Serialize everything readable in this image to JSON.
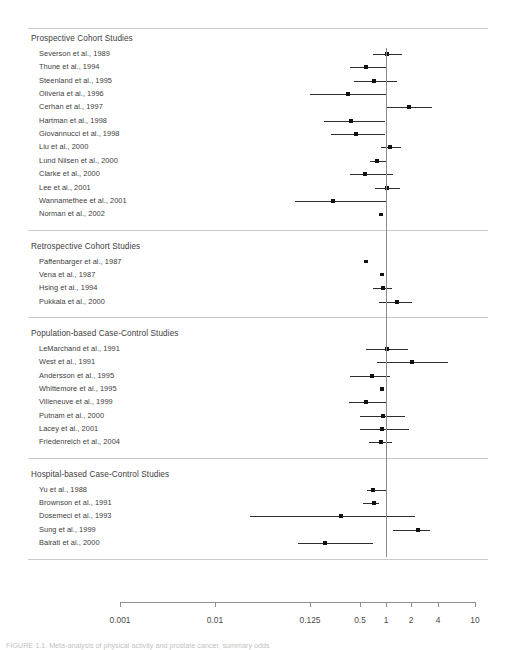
{
  "chart_data": {
    "type": "scatter",
    "title": "",
    "xlabel": "",
    "ylabel": "",
    "xscale": "log",
    "xlim": [
      0.001,
      10
    ],
    "grid": false,
    "legend": null,
    "reference_line": 1,
    "tick_labels": [
      "0.001",
      "0.01",
      "0.125",
      "0.5",
      "1",
      "2",
      "4",
      "10"
    ],
    "tick_values": [
      0.001,
      0.01,
      0.125,
      0.5,
      1,
      2,
      4,
      10
    ],
    "tick_x_px": [
      120,
      215,
      310,
      360,
      386,
      411,
      438,
      475
    ],
    "groups": [
      {
        "name": "Prospective Cohort Studies",
        "rows": [
          {
            "label": "Severson et al., 1989",
            "x_px": 387,
            "lo_px": 373,
            "hi_px": 402,
            "size": 4.0
          },
          {
            "label": "Thune et al., 1994",
            "x_px": 366,
            "lo_px": 350,
            "hi_px": 386,
            "size": 4.0
          },
          {
            "label": "Steenland et al., 1995",
            "x_px": 374,
            "lo_px": 354,
            "hi_px": 397,
            "size": 4.0
          },
          {
            "label": "Oliveria et al., 1996",
            "x_px": 348,
            "lo_px": 310,
            "hi_px": 386,
            "size": 4.0
          },
          {
            "label": "Cerhan et al., 1997",
            "x_px": 409,
            "lo_px": 386,
            "hi_px": 432,
            "size": 4.0
          },
          {
            "label": "Hartman et al., 1998",
            "x_px": 351,
            "lo_px": 324,
            "hi_px": 385,
            "size": 4.0
          },
          {
            "label": "Giovannucci et al., 1998",
            "x_px": 356,
            "lo_px": 331,
            "hi_px": 385,
            "size": 4.0
          },
          {
            "label": "Liu et al., 2000",
            "x_px": 390,
            "lo_px": 381,
            "hi_px": 401,
            "size": 4.0
          },
          {
            "label": "Lund Nilsen et al., 2000",
            "x_px": 377,
            "lo_px": 370,
            "hi_px": 386,
            "size": 4.0
          },
          {
            "label": "Clarke et al., 2000",
            "x_px": 365,
            "lo_px": 350,
            "hi_px": 393,
            "size": 4.0
          },
          {
            "label": "Lee et al., 2001",
            "x_px": 387,
            "lo_px": 375,
            "hi_px": 400,
            "size": 4.0
          },
          {
            "label": "Wannamethee et al., 2001",
            "x_px": 333,
            "lo_px": 295,
            "hi_px": 386,
            "size": 4.0
          },
          {
            "label": "Norman et al., 2002",
            "x_px": 381,
            "lo_px": null,
            "hi_px": null,
            "size": 3.4
          }
        ]
      },
      {
        "name": "Retrospective Cohort Studies",
        "rows": [
          {
            "label": "Paffenbarger et al., 1987",
            "x_px": 366,
            "lo_px": null,
            "hi_px": null,
            "size": 3.2
          },
          {
            "label": "Vena et al., 1987",
            "x_px": 382,
            "lo_px": null,
            "hi_px": null,
            "size": 3.2
          },
          {
            "label": "Hsing et al., 1994",
            "x_px": 383,
            "lo_px": 373,
            "hi_px": 392,
            "size": 4.0
          },
          {
            "label": "Pukkala et al., 2000",
            "x_px": 397,
            "lo_px": 379,
            "hi_px": 412,
            "size": 4.0
          }
        ]
      },
      {
        "name": "Population-based Case-Control Studies",
        "rows": [
          {
            "label": "LeMarchand et al., 1991",
            "x_px": 387,
            "lo_px": 366,
            "hi_px": 408,
            "size": 4.0
          },
          {
            "label": "West et al., 1991",
            "x_px": 412,
            "lo_px": 377,
            "hi_px": 448,
            "size": 4.0
          },
          {
            "label": "Andersson et al., 1995",
            "x_px": 372,
            "lo_px": 350,
            "hi_px": 390,
            "size": 4.0
          },
          {
            "label": "Whittemore et al., 1995",
            "x_px": 382,
            "lo_px": null,
            "hi_px": null,
            "size": 3.2
          },
          {
            "label": "Villeneuve et al., 1999",
            "x_px": 366,
            "lo_px": 349,
            "hi_px": 386,
            "size": 4.0
          },
          {
            "label": "Putnam et al., 2000",
            "x_px": 383,
            "lo_px": 360,
            "hi_px": 405,
            "size": 4.0
          },
          {
            "label": "Lacey et al., 2001",
            "x_px": 382,
            "lo_px": 360,
            "hi_px": 409,
            "size": 4.0
          },
          {
            "label": "Friedenreich et al., 2004",
            "x_px": 381,
            "lo_px": 369,
            "hi_px": 392,
            "size": 4.0
          }
        ]
      },
      {
        "name": "Hospital-based Case-Control Studies",
        "rows": [
          {
            "label": "Yu et al., 1988",
            "x_px": 373,
            "lo_px": 367,
            "hi_px": 387,
            "size": 3.6
          },
          {
            "label": "Brownson et al., 1991",
            "x_px": 374,
            "lo_px": 363,
            "hi_px": 379,
            "size": 3.6
          },
          {
            "label": "Dosemeci et al., 1993",
            "x_px": 341,
            "lo_px": 250,
            "hi_px": 415,
            "size": 4.0
          },
          {
            "label": "Sung et al., 1999",
            "x_px": 418,
            "lo_px": 393,
            "hi_px": 430,
            "size": 4.0
          },
          {
            "label": "Bairati et al., 2000",
            "x_px": 325,
            "lo_px": 298,
            "hi_px": 373,
            "size": 4.0
          }
        ]
      }
    ]
  },
  "caption": {
    "text": "FIGURE 1.1. Meta-analysis of physical activity and prostate cancer, summary odds"
  }
}
